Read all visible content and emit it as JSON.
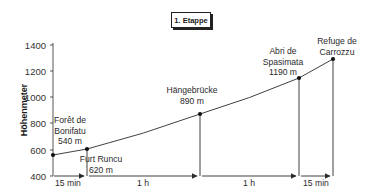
{
  "chart_data": {
    "type": "line",
    "title": "1. Etappe",
    "xlabel": "",
    "ylabel": "Höhenmeter",
    "ylim": [
      400,
      1400
    ],
    "yticks": [
      400,
      600,
      800,
      1000,
      1200,
      1400
    ],
    "grid": false,
    "points": [
      {
        "name": "Forêt de Bonifatu",
        "label_lines": [
          "Forêt de",
          "Bonifatu",
          "540 m"
        ],
        "altitude_m": 540
      },
      {
        "name": "Furt Runcu",
        "label_lines": [
          "Furt Runcu",
          "620 m"
        ],
        "altitude_m": 620
      },
      {
        "name": "Hängebrücke",
        "label_lines": [
          "Hängebrücke",
          "890 m"
        ],
        "altitude_m": 890
      },
      {
        "name": "Abri de Spasimata",
        "label_lines": [
          "Abri de",
          "Spasimata",
          "1190 m"
        ],
        "altitude_m": 1190
      },
      {
        "name": "Refuge de Carrozzu",
        "label_lines": [
          "Refuge de",
          "Carrozzu"
        ],
        "altitude_m": 1270
      }
    ],
    "segments": [
      {
        "from": "Forêt de Bonifatu",
        "to": "Furt Runcu",
        "duration": "15 min"
      },
      {
        "from": "Furt Runcu",
        "to": "Hängebrücke",
        "duration": "1 h"
      },
      {
        "from": "Hängebrücke",
        "to": "Abri de Spasimata",
        "duration": "1 h"
      },
      {
        "from": "Abri de Spasimata",
        "to": "Refuge de Carrozzu",
        "duration": "15 min"
      }
    ]
  },
  "layout": {
    "axis_x": 53,
    "baseline_y": 176,
    "point_px": [
      [
        53,
        155
      ],
      [
        87,
        149
      ],
      [
        200,
        114
      ],
      [
        299,
        78
      ],
      [
        333,
        59
      ]
    ],
    "tick_px": {
      "400": 176,
      "600": 150,
      "800": 123,
      "1000": 97,
      "1200": 71,
      "1400": 45
    }
  },
  "colors": {
    "line": "#2b2b2b",
    "text": "#2a2a2a"
  }
}
